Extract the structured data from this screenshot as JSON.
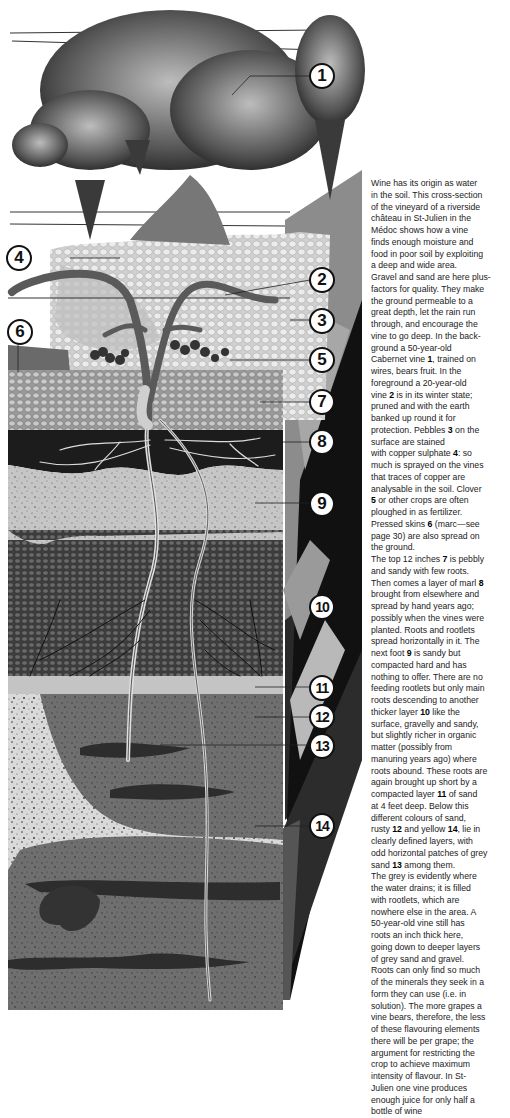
{
  "figure": {
    "callouts": [
      {
        "n": "1",
        "label": "50-year-old Cabernet vine, trained on wires"
      },
      {
        "n": "2",
        "label": "20-year-old vine in winter state"
      },
      {
        "n": "3",
        "label": "Pebbles"
      },
      {
        "n": "4",
        "label": "Copper sulphate"
      },
      {
        "n": "5",
        "label": "Clover"
      },
      {
        "n": "6",
        "label": "Pressed skins (marc)"
      },
      {
        "n": "7",
        "label": "Top 12 inches, pebbly and sandy"
      },
      {
        "n": "8",
        "label": "Layer of marl"
      },
      {
        "n": "9",
        "label": "Next foot, sandy but compacted hard"
      },
      {
        "n": "10",
        "label": "Thicker layer, gravelly and sandy"
      },
      {
        "n": "11",
        "label": "Compacted layer of sand at 4 feet"
      },
      {
        "n": "12",
        "label": "Rusty sand"
      },
      {
        "n": "13",
        "label": "Grey sand patches"
      },
      {
        "n": "14",
        "label": "Yellow sand"
      }
    ]
  },
  "caption": {
    "lines": [
      "Wine has its origin as water",
      "in the soil. This cross-section",
      "of the vineyard of a riverside",
      "château in St-Julien in the",
      "Médoc shows how a vine",
      "finds enough moisture and",
      "food in poor soil by exploiting",
      "a deep and wide area.",
      "Gravel and sand are here plus-",
      "factors for quality. They make",
      "the ground permeable to a",
      "great depth, let the rain run",
      "through, and encourage the",
      "vine to go deep. In the back-",
      "ground a 50-year-old",
      "Cabernet vine [1], trained on",
      "wires, bears fruit. In the",
      "foreground a 20-year-old",
      "vine [2] is in its winter state;",
      "pruned and with the earth",
      "banked up round it for",
      "protection. Pebbles [3] on the",
      "surface are stained",
      "with copper sulphate [4]: so",
      "much is sprayed on the vines",
      "that traces of copper are",
      "analysable in the soil. Clover",
      "[5] or other crops are often",
      "ploughed in as fertilizer.",
      "Pressed skins [6] (marc—see",
      "page 30) are also spread on",
      "the ground.",
      "The top 12 inches [7] is pebbly",
      "and sandy with few roots.",
      "Then comes a layer of marl [8]",
      "brought from elsewhere and",
      "spread by hand years ago;",
      "possibly when the vines were",
      "planted. Roots and rootlets",
      "spread horizontally in it. The",
      "next foot [9] is sandy but",
      "compacted hard and has",
      "nothing to offer. There are no",
      "feeding rootlets but only main",
      "roots descending to another",
      "thicker layer [10] like the",
      "surface, gravelly and sandy,",
      "but slightly richer in organic",
      "matter (possibly from",
      "manuring years ago) where",
      "roots abound. These roots are",
      "again brought up short by a",
      "compacted layer [11] of sand",
      "at 4 feet deep. Below this",
      "different colours of sand,",
      "rusty [12] and yellow [14], lie in",
      "clearly defined layers, with",
      "odd horizontal patches of grey",
      "sand [13] among them.",
      "The grey is evidently where",
      "the water drains; it is filled",
      "with rootlets, which are",
      "nowhere else in the area. A",
      "50-year-old vine still has",
      "roots an inch thick here,",
      "going down to deeper layers",
      "of grey sand and gravel.",
      "Roots can only find so much",
      "of the minerals they seek in a",
      "form they can use (i.e. in",
      "solution). The more grapes a",
      "vine bears, therefore, the less",
      "of these flavouring elements",
      "there will be per grape; the",
      "argument for restricting the",
      "crop to achieve maximum",
      "intensity of flavour. In St-",
      "Julien one vine produces",
      "enough juice for only half a",
      "bottle of wine"
    ]
  },
  "colors": {
    "background": "#ffffff",
    "text": "#222222",
    "callout_border": "#111111"
  }
}
